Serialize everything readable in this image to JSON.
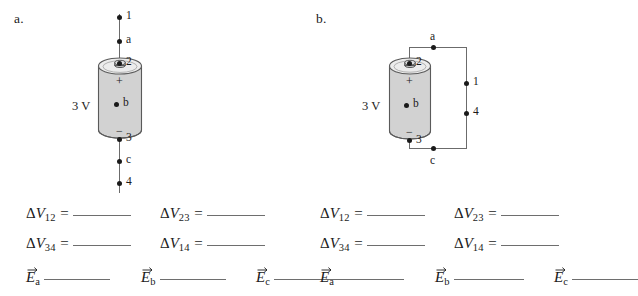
{
  "figure": {
    "panels": [
      {
        "label": "a.",
        "battery": {
          "voltage_label": "3 V",
          "plus_sign": "+",
          "minus_sign": "−",
          "center_point_label": "b",
          "top_terminal_label": "2",
          "bottom_terminal_label": "3",
          "fill_color": "#d2d2d2",
          "stroke_color": "#5a5a5a"
        },
        "circuit_type": "open-vertical-wire",
        "nodes": [
          {
            "id": "1",
            "label": "1"
          },
          {
            "id": "a",
            "label": "a"
          },
          {
            "id": "2",
            "label": "2"
          },
          {
            "id": "b",
            "label": "b"
          },
          {
            "id": "3",
            "label": "3"
          },
          {
            "id": "c",
            "label": "c"
          },
          {
            "id": "4",
            "label": "4"
          }
        ]
      },
      {
        "label": "b.",
        "battery": {
          "voltage_label": "3 V",
          "plus_sign": "+",
          "minus_sign": "−",
          "center_point_label": "b",
          "top_terminal_label": "2",
          "bottom_terminal_label": "3",
          "fill_color": "#d2d2d2",
          "stroke_color": "#5a5a5a"
        },
        "circuit_type": "closed-rectangular-loop",
        "nodes": [
          {
            "id": "a",
            "label": "a"
          },
          {
            "id": "1",
            "label": "1"
          },
          {
            "id": "4",
            "label": "4"
          },
          {
            "id": "c",
            "label": "c"
          },
          {
            "id": "2",
            "label": "2"
          },
          {
            "id": "b",
            "label": "b"
          },
          {
            "id": "3",
            "label": "3"
          }
        ]
      }
    ]
  },
  "equations": {
    "delta_symbol": "Δ",
    "v_symbol": "V",
    "e_symbol": "E",
    "equals": "=",
    "rows": [
      [
        {
          "kind": "deltaV",
          "sub": "12"
        },
        {
          "kind": "deltaV",
          "sub": "23"
        }
      ],
      [
        {
          "kind": "deltaV",
          "sub": "34"
        },
        {
          "kind": "deltaV",
          "sub": "14"
        }
      ],
      [
        {
          "kind": "evec",
          "sub": "a"
        },
        {
          "kind": "evec",
          "sub": "b"
        },
        {
          "kind": "evec",
          "sub": "c"
        }
      ]
    ],
    "labels": {
      "dv12": "ΔV12",
      "dv23": "ΔV23",
      "dv34": "ΔV34",
      "dv14": "ΔV14",
      "ea": "Ea",
      "eb": "Eb",
      "ec": "Ec"
    }
  },
  "colors": {
    "background": "#ffffff",
    "ink": "#1a1a1a",
    "wire": "#6b6b6b",
    "blank_rule": "#6e6e6e",
    "battery_fill": "#d2d2d2"
  }
}
